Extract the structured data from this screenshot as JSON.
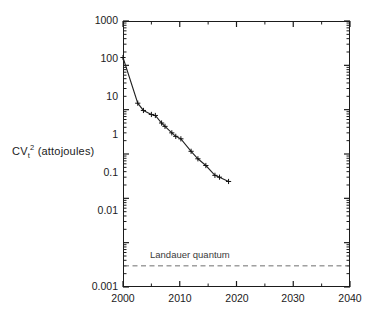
{
  "chart_data": {
    "type": "line",
    "title": "",
    "subtitle": "",
    "xlabel": "",
    "ylabel": "CVt2 (attojoules)",
    "ylabel_parts": {
      "base": "CV",
      "subscript": "t",
      "superscript": "2",
      "units": "(attojoules)"
    },
    "xscale": "linear",
    "yscale": "log",
    "xlim": [
      2000,
      2040
    ],
    "ylim": [
      0.001,
      1000
    ],
    "grid": false,
    "legend": false,
    "legend_position": "none",
    "xticks": [
      2000,
      2010,
      2020,
      2030,
      2040
    ],
    "xtick_labels": [
      "2000",
      "2010",
      "2020",
      "2030",
      "2040"
    ],
    "xminor_ticks": [
      2005,
      2015,
      2025,
      2035
    ],
    "yticks": [
      0.001,
      0.01,
      0.1,
      1,
      10,
      100,
      1000
    ],
    "ytick_labels": [
      "0.001",
      "0.01",
      "0.1",
      "1",
      "10",
      "100",
      "1000"
    ],
    "series": [
      {
        "name": "CVt^2 switching energy",
        "marker": "plus",
        "color": "#222222",
        "points": [
          {
            "x": 2000.0,
            "y": 150
          },
          {
            "x": 2002.6,
            "y": 14
          },
          {
            "x": 2003.6,
            "y": 9.6
          },
          {
            "x": 2005.0,
            "y": 7.8
          },
          {
            "x": 2005.7,
            "y": 7.4
          },
          {
            "x": 2006.8,
            "y": 5.0
          },
          {
            "x": 2007.4,
            "y": 4.2
          },
          {
            "x": 2008.6,
            "y": 3.0
          },
          {
            "x": 2009.3,
            "y": 2.5
          },
          {
            "x": 2010.2,
            "y": 2.2
          },
          {
            "x": 2012.0,
            "y": 1.15
          },
          {
            "x": 2013.2,
            "y": 0.78
          },
          {
            "x": 2014.6,
            "y": 0.55
          },
          {
            "x": 2016.2,
            "y": 0.33
          },
          {
            "x": 2017.0,
            "y": 0.3
          },
          {
            "x": 2018.6,
            "y": 0.24
          }
        ]
      }
    ],
    "reference_lines": [
      {
        "name": "Landauer quantum",
        "label": "Landauer quantum",
        "y": 0.003,
        "style": "dashed",
        "color": "#6e6e6e"
      }
    ]
  }
}
